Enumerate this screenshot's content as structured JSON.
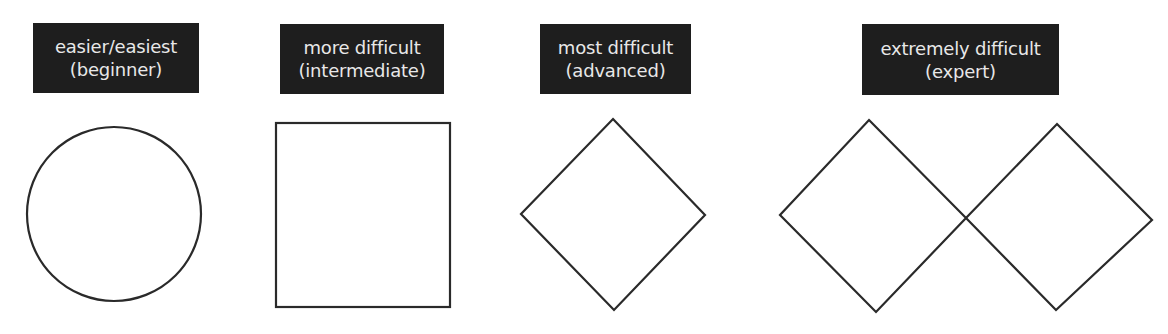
{
  "colors": {
    "label_background": "#1e1e1e",
    "label_text": "#e8e8e8",
    "shape_stroke": "#2a2a2a",
    "page_background": "#ffffff"
  },
  "ratings": [
    {
      "line1": "easier/easiest",
      "line2": "(beginner)",
      "symbol": "circle",
      "icon": "circle-icon"
    },
    {
      "line1": "more difficult",
      "line2": "(intermediate)",
      "symbol": "square",
      "icon": "square-icon"
    },
    {
      "line1": "most difficult",
      "line2": "(advanced)",
      "symbol": "diamond",
      "icon": "diamond-icon"
    },
    {
      "line1": "extremely difficult",
      "line2": "(expert)",
      "symbol": "double-diamond",
      "icon": "double-diamond-icon"
    }
  ]
}
